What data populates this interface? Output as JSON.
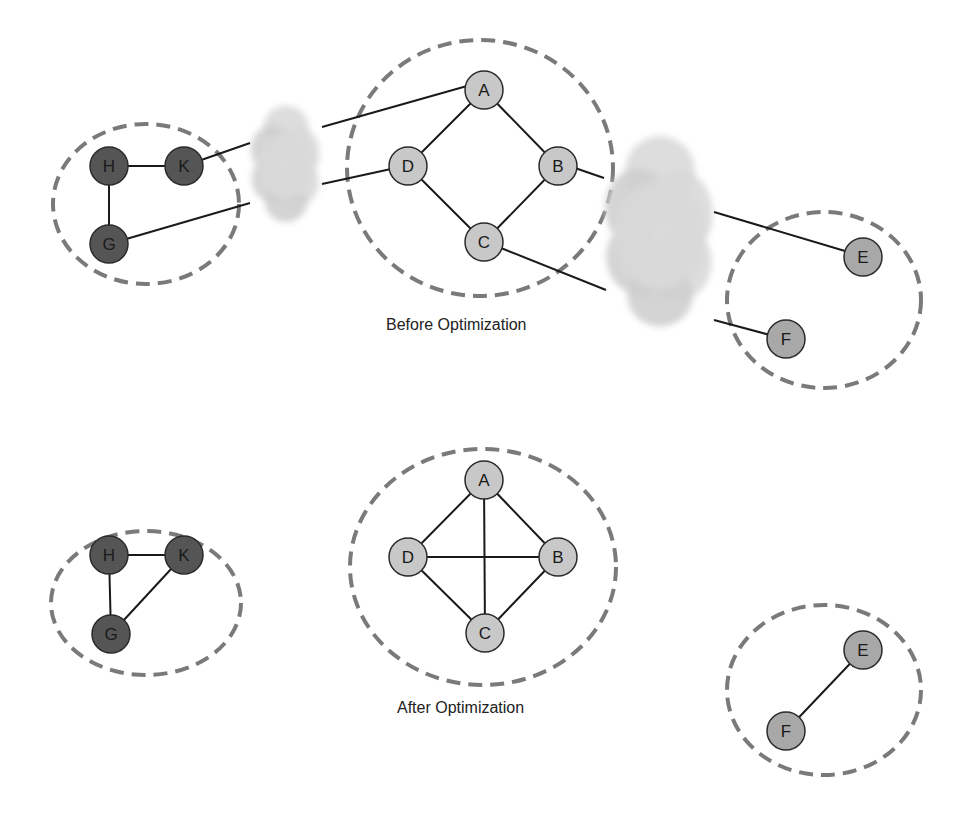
{
  "colors": {
    "cluster_dashed": "#7a7a7a",
    "edge": "#1a1a1a",
    "node_dark": "#555555",
    "node_light": "#c8c8c8",
    "node_mid": "#a8a8a8",
    "cloud": "#d9d9d9"
  },
  "before": {
    "caption": "Before Optimization",
    "caption_pos": [
      386,
      333
    ],
    "clusters": [
      {
        "id": "hkg",
        "cx": 146,
        "cy": 204,
        "rx": 93,
        "ry": 80
      },
      {
        "id": "abcd",
        "cx": 480,
        "cy": 168,
        "rx": 133,
        "ry": 128
      },
      {
        "id": "ef",
        "cx": 824,
        "cy": 300,
        "rx": 97,
        "ry": 88
      }
    ],
    "clouds": [
      {
        "id": "cloud-left",
        "cx": 286,
        "cy": 166,
        "w": 70,
        "h": 110
      },
      {
        "id": "cloud-right",
        "cx": 660,
        "cy": 235,
        "w": 110,
        "h": 180
      }
    ],
    "nodes": [
      {
        "id": "H",
        "label": "H",
        "x": 109,
        "y": 166,
        "tone": "dark"
      },
      {
        "id": "K",
        "label": "K",
        "x": 184,
        "y": 166,
        "tone": "dark"
      },
      {
        "id": "G",
        "label": "G",
        "x": 109,
        "y": 244,
        "tone": "dark"
      },
      {
        "id": "A",
        "label": "A",
        "x": 484,
        "y": 90,
        "tone": "light"
      },
      {
        "id": "D",
        "label": "D",
        "x": 408,
        "y": 166,
        "tone": "light"
      },
      {
        "id": "B",
        "label": "B",
        "x": 558,
        "y": 166,
        "tone": "light"
      },
      {
        "id": "C",
        "label": "C",
        "x": 484,
        "y": 242,
        "tone": "light"
      },
      {
        "id": "E",
        "label": "E",
        "x": 863,
        "y": 257,
        "tone": "mid"
      },
      {
        "id": "F",
        "label": "F",
        "x": 786,
        "y": 339,
        "tone": "mid"
      }
    ],
    "edges": [
      [
        109,
        166,
        184,
        166
      ],
      [
        109,
        166,
        109,
        244
      ],
      [
        484,
        90,
        408,
        166
      ],
      [
        484,
        90,
        558,
        166
      ],
      [
        408,
        166,
        484,
        242
      ],
      [
        558,
        166,
        484,
        242
      ],
      [
        184,
        166,
        250,
        143
      ],
      [
        109,
        244,
        250,
        203
      ],
      [
        322,
        127,
        467,
        86
      ],
      [
        322,
        184,
        391,
        169
      ],
      [
        575,
        168,
        604,
        178
      ],
      [
        501,
        248,
        606,
        290
      ],
      [
        714,
        212,
        845,
        251
      ],
      [
        714,
        320,
        770,
        335
      ]
    ]
  },
  "after": {
    "caption": "After Optimization",
    "caption_pos": [
      397,
      716
    ],
    "clusters": [
      {
        "id": "hkg",
        "cx": 146,
        "cy": 603,
        "rx": 95,
        "ry": 72
      },
      {
        "id": "abcd",
        "cx": 483,
        "cy": 567,
        "rx": 133,
        "ry": 118
      },
      {
        "id": "ef",
        "cx": 824,
        "cy": 690,
        "rx": 97,
        "ry": 85
      }
    ],
    "nodes": [
      {
        "id": "H",
        "label": "H",
        "x": 109,
        "y": 555,
        "tone": "dark"
      },
      {
        "id": "K",
        "label": "K",
        "x": 184,
        "y": 555,
        "tone": "dark"
      },
      {
        "id": "G",
        "label": "G",
        "x": 111,
        "y": 634,
        "tone": "dark"
      },
      {
        "id": "A",
        "label": "A",
        "x": 484,
        "y": 480,
        "tone": "light"
      },
      {
        "id": "D",
        "label": "D",
        "x": 408,
        "y": 557,
        "tone": "light"
      },
      {
        "id": "B",
        "label": "B",
        "x": 558,
        "y": 557,
        "tone": "light"
      },
      {
        "id": "C",
        "label": "C",
        "x": 485,
        "y": 633,
        "tone": "light"
      },
      {
        "id": "E",
        "label": "E",
        "x": 863,
        "y": 650,
        "tone": "mid"
      },
      {
        "id": "F",
        "label": "F",
        "x": 786,
        "y": 731,
        "tone": "mid"
      }
    ],
    "edges": [
      [
        109,
        555,
        184,
        555
      ],
      [
        109,
        555,
        111,
        634
      ],
      [
        184,
        555,
        111,
        634
      ],
      [
        484,
        480,
        408,
        557
      ],
      [
        484,
        480,
        558,
        557
      ],
      [
        408,
        557,
        485,
        633
      ],
      [
        558,
        557,
        485,
        633
      ],
      [
        484,
        480,
        485,
        633
      ],
      [
        408,
        557,
        558,
        557
      ],
      [
        863,
        650,
        786,
        731
      ]
    ]
  }
}
